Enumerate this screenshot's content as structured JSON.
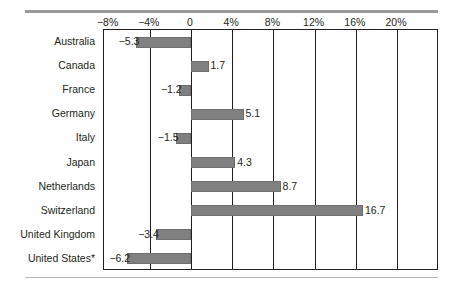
{
  "chart_data": {
    "type": "bar",
    "orientation": "horizontal",
    "title": "",
    "xlabel": "",
    "ylabel": "",
    "xlim": [
      -10,
      22
    ],
    "grid": true,
    "legend": false,
    "tick_labels": [
      "−8%",
      "−4%",
      "0",
      "4%",
      "8%",
      "12%",
      "16%",
      "20%"
    ],
    "ticks": [
      -8,
      -4,
      0,
      4,
      8,
      12,
      16,
      20
    ],
    "categories": [
      "Australia",
      "Canada",
      "France",
      "Germany",
      "Italy",
      "Japan",
      "Netherlands",
      "Switzerland",
      "United Kingdom",
      "United States*"
    ],
    "values": [
      -5.3,
      1.7,
      -1.2,
      5.1,
      -1.5,
      4.3,
      8.7,
      16.7,
      -3.4,
      -6.2
    ],
    "value_labels": [
      "−5.3",
      "1.7",
      "−1.2",
      "5.1",
      "−1.5",
      "4.3",
      "8.7",
      "16.7",
      "−3.4",
      "−6.2"
    ],
    "bar_color": "#808080",
    "axis_color": "#231f20",
    "rule_color": "#9a9a9a"
  }
}
